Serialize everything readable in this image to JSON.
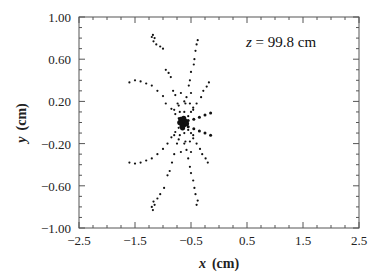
{
  "chart_data": {
    "type": "scatter",
    "title": "",
    "xlabel_var": "x",
    "xlabel_unit": "(cm)",
    "ylabel_var": "y",
    "ylabel_unit": "(cm)",
    "xlim": [
      -2.5,
      2.5
    ],
    "ylim": [
      -1.0,
      1.0
    ],
    "xticks": [
      -2.5,
      -1.5,
      -0.5,
      0.5,
      1.5,
      2.5
    ],
    "xtick_labels": [
      "−2.5",
      "−1.5",
      "−0.5",
      "0.5",
      "1.5",
      "2.5"
    ],
    "x_minor_step": 0.25,
    "yticks": [
      1.0,
      0.6,
      0.2,
      -0.2,
      -0.6,
      -1.0
    ],
    "ytick_labels": [
      "1.00",
      "0.60",
      "0.20",
      "−0.20",
      "−0.60",
      "−1.00"
    ],
    "y_minor_step": 0.1,
    "grid": false,
    "legend": null,
    "annotation": {
      "var": "z",
      "text": " = 99.8 cm",
      "position": "top-right"
    },
    "center": [
      -0.64,
      -0.01
    ],
    "series": [
      {
        "name": "upper-left-far-arm",
        "points": [
          [
            -1.2,
            0.81
          ],
          [
            -1.18,
            0.83
          ],
          [
            -1.15,
            0.8
          ],
          [
            -1.17,
            0.77
          ],
          [
            -1.12,
            0.74
          ],
          [
            -1.05,
            0.72
          ],
          [
            -1.0,
            0.7
          ],
          [
            -0.95,
            0.5
          ],
          [
            -0.9,
            0.47
          ],
          [
            -0.86,
            0.43
          ],
          [
            -0.82,
            0.3
          ],
          [
            -0.78,
            0.26
          ],
          [
            -0.74,
            0.18
          ],
          [
            -0.7,
            0.1
          ]
        ]
      },
      {
        "name": "upper-arm",
        "points": [
          [
            -0.38,
            0.78
          ],
          [
            -0.4,
            0.74
          ],
          [
            -0.42,
            0.68
          ],
          [
            -0.44,
            0.6
          ],
          [
            -0.45,
            0.55
          ],
          [
            -0.5,
            0.48
          ],
          [
            -0.52,
            0.4
          ],
          [
            -0.54,
            0.35
          ],
          [
            -0.58,
            0.24
          ],
          [
            -0.6,
            0.18
          ],
          [
            -0.62,
            0.1
          ]
        ]
      },
      {
        "name": "upper-left-near-arm",
        "points": [
          [
            -1.6,
            0.38
          ],
          [
            -1.5,
            0.4
          ],
          [
            -1.4,
            0.39
          ],
          [
            -1.3,
            0.37
          ],
          [
            -1.2,
            0.35
          ],
          [
            -1.1,
            0.3
          ],
          [
            -1.0,
            0.25
          ],
          [
            -0.95,
            0.18
          ],
          [
            -0.85,
            0.13
          ],
          [
            -0.78,
            0.08
          ],
          [
            -0.72,
            0.04
          ]
        ]
      },
      {
        "name": "upper-right-arm",
        "points": [
          [
            -0.18,
            0.38
          ],
          [
            -0.22,
            0.34
          ],
          [
            -0.28,
            0.3
          ],
          [
            -0.32,
            0.24
          ],
          [
            -0.4,
            0.18
          ],
          [
            -0.46,
            0.14
          ],
          [
            -0.5,
            0.1
          ],
          [
            -0.55,
            0.06
          ]
        ]
      },
      {
        "name": "inner-ring-upper",
        "points": [
          [
            -0.72,
            0.16
          ],
          [
            -0.62,
            0.2
          ],
          [
            -0.52,
            0.18
          ],
          [
            -0.46,
            0.12
          ],
          [
            -0.8,
            0.12
          ],
          [
            -0.68,
            0.28
          ],
          [
            -0.5,
            0.28
          ]
        ]
      },
      {
        "name": "right-rays",
        "points": [
          [
            -0.55,
            0.02
          ],
          [
            -0.45,
            0.03
          ],
          [
            -0.35,
            0.05
          ],
          [
            -0.25,
            0.07
          ],
          [
            -0.15,
            0.09
          ],
          [
            -0.55,
            -0.04
          ],
          [
            -0.45,
            -0.06
          ],
          [
            -0.35,
            -0.08
          ],
          [
            -0.25,
            -0.1
          ],
          [
            -0.15,
            -0.12
          ]
        ]
      },
      {
        "name": "lower-left-far-arm",
        "points": [
          [
            -1.2,
            -0.8
          ],
          [
            -1.18,
            -0.83
          ],
          [
            -1.15,
            -0.78
          ],
          [
            -1.17,
            -0.75
          ],
          [
            -1.1,
            -0.72
          ],
          [
            -1.05,
            -0.68
          ],
          [
            -0.98,
            -0.62
          ],
          [
            -0.92,
            -0.5
          ],
          [
            -0.88,
            -0.46
          ],
          [
            -0.84,
            -0.38
          ],
          [
            -0.8,
            -0.3
          ],
          [
            -0.75,
            -0.2
          ],
          [
            -0.7,
            -0.12
          ]
        ]
      },
      {
        "name": "lower-arm",
        "points": [
          [
            -0.4,
            -0.78
          ],
          [
            -0.38,
            -0.74
          ],
          [
            -0.42,
            -0.68
          ],
          [
            -0.44,
            -0.62
          ],
          [
            -0.46,
            -0.55
          ],
          [
            -0.5,
            -0.48
          ],
          [
            -0.52,
            -0.42
          ],
          [
            -0.55,
            -0.34
          ],
          [
            -0.58,
            -0.26
          ],
          [
            -0.6,
            -0.18
          ],
          [
            -0.62,
            -0.1
          ]
        ]
      },
      {
        "name": "lower-left-near-arm",
        "points": [
          [
            -1.6,
            -0.38
          ],
          [
            -1.5,
            -0.39
          ],
          [
            -1.4,
            -0.38
          ],
          [
            -1.3,
            -0.36
          ],
          [
            -1.2,
            -0.34
          ],
          [
            -1.1,
            -0.3
          ],
          [
            -1.0,
            -0.25
          ],
          [
            -0.92,
            -0.2
          ],
          [
            -0.85,
            -0.14
          ],
          [
            -0.78,
            -0.09
          ],
          [
            -0.72,
            -0.05
          ]
        ]
      },
      {
        "name": "lower-right-arm",
        "points": [
          [
            -0.2,
            -0.38
          ],
          [
            -0.24,
            -0.34
          ],
          [
            -0.3,
            -0.3
          ],
          [
            -0.34,
            -0.25
          ],
          [
            -0.4,
            -0.2
          ],
          [
            -0.46,
            -0.15
          ],
          [
            -0.5,
            -0.1
          ],
          [
            -0.55,
            -0.07
          ]
        ]
      },
      {
        "name": "inner-ring-lower",
        "points": [
          [
            -0.72,
            -0.16
          ],
          [
            -0.62,
            -0.2
          ],
          [
            -0.52,
            -0.18
          ],
          [
            -0.46,
            -0.12
          ],
          [
            -0.8,
            -0.12
          ],
          [
            -0.68,
            -0.28
          ],
          [
            -0.5,
            -0.28
          ]
        ]
      },
      {
        "name": "core",
        "points": [
          [
            -0.66,
            0.0
          ],
          [
            -0.64,
            0.02
          ],
          [
            -0.62,
            -0.02
          ],
          [
            -0.68,
            0.03
          ],
          [
            -0.6,
            0.01
          ],
          [
            -0.66,
            -0.03
          ],
          [
            -0.63,
            0.04
          ],
          [
            -0.65,
            -0.05
          ],
          [
            -0.7,
            0.0
          ],
          [
            -0.58,
            -0.01
          ]
        ]
      }
    ]
  }
}
